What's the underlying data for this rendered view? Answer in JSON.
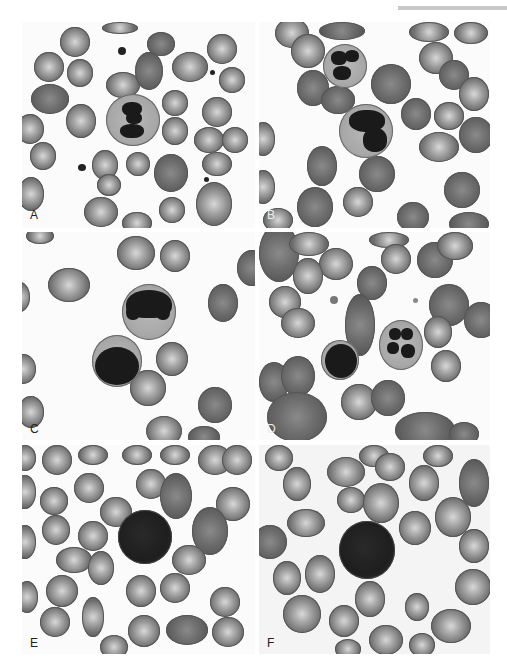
{
  "figure": {
    "panels": [
      {
        "id": "A",
        "label": "A",
        "description": "Segmented neutrophil among red blood cells"
      },
      {
        "id": "B",
        "label": "B",
        "description": "Neutrophil and band/atypical granulocyte among red blood cells"
      },
      {
        "id": "C",
        "label": "C",
        "description": "Band neutrophil and lymphocyte"
      },
      {
        "id": "D",
        "label": "D",
        "description": "Lymphocyte and segmented neutrophil"
      },
      {
        "id": "E",
        "label": "E",
        "description": "Basophil among red blood cells"
      },
      {
        "id": "F",
        "label": "F",
        "description": "Basophil among red blood cells"
      }
    ]
  }
}
